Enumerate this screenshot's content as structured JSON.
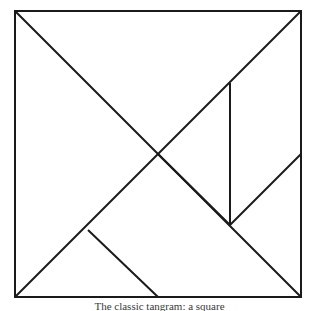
{
  "figure": {
    "name": "tangram-square",
    "title": "Tangram",
    "caption": "The classic tangram: a square",
    "background_color": "#ffffff",
    "stroke_color": "#1a1a1a",
    "stroke_width": 2,
    "square": {
      "x": 15,
      "y": 11,
      "width": 287,
      "height": 287
    }
  },
  "chart_data": {
    "type": "diagram",
    "canvas": {
      "width": 319,
      "height": 311
    },
    "square_corners": {
      "top_left": [
        15,
        11
      ],
      "top_right": [
        301,
        11
      ],
      "bottom_right": [
        301,
        297
      ],
      "bottom_left": [
        15,
        297
      ]
    },
    "key_points": {
      "center": [
        158,
        154
      ],
      "right_edge_mid": [
        301,
        154
      ],
      "bottom_edge_mid": [
        158,
        297
      ],
      "vertical_top": [
        230,
        83
      ],
      "vertical_bottom": [
        230,
        225
      ],
      "left_lower_vertex": [
        88,
        230
      ]
    },
    "cut_lines": [
      {
        "name": "main-diagonal-tl-br",
        "from": [
          15,
          11
        ],
        "to": [
          301,
          297
        ]
      },
      {
        "name": "anti-diagonal-bl-tr",
        "from": [
          15,
          297
        ],
        "to": [
          301,
          11
        ]
      },
      {
        "name": "vertical-cut",
        "from": [
          230,
          83
        ],
        "to": [
          230,
          225
        ]
      },
      {
        "name": "center-to-vertical-bottom",
        "from": [
          158,
          154
        ],
        "to": [
          230,
          225
        ]
      },
      {
        "name": "vertical-bottom-to-right-mid",
        "from": [
          230,
          225
        ],
        "to": [
          301,
          154
        ]
      },
      {
        "name": "left-vertex-to-bottom-mid",
        "from": [
          88,
          230
        ],
        "to": [
          158,
          297
        ]
      }
    ],
    "pieces": [
      {
        "name": "large-triangle-upper-left",
        "points": [
          [
            15,
            11
          ],
          [
            301,
            11
          ],
          [
            158,
            154
          ]
        ]
      },
      {
        "name": "large-triangle-lower-left",
        "points": [
          [
            15,
            11
          ],
          [
            158,
            154
          ],
          [
            15,
            297
          ]
        ]
      },
      {
        "name": "medium-triangle",
        "points": [
          [
            230,
            83
          ],
          [
            230,
            225
          ],
          [
            158,
            154
          ]
        ]
      },
      {
        "name": "small-triangle-right",
        "points": [
          [
            230,
            225
          ],
          [
            301,
            154
          ],
          [
            301,
            297
          ]
        ]
      },
      {
        "name": "small-triangle-bottom",
        "points": [
          [
            88,
            230
          ],
          [
            158,
            297
          ],
          [
            158,
            297
          ]
        ]
      },
      {
        "name": "square-piece",
        "points": [
          [
            158,
            154
          ],
          [
            230,
            225
          ],
          [
            158,
            297
          ],
          [
            88,
            230
          ]
        ]
      },
      {
        "name": "parallelogram",
        "points": [
          [
            230,
            83
          ],
          [
            301,
            11
          ],
          [
            301,
            154
          ],
          [
            230,
            225
          ]
        ]
      }
    ],
    "piece_count": 7,
    "grid": false,
    "legend": "none"
  }
}
